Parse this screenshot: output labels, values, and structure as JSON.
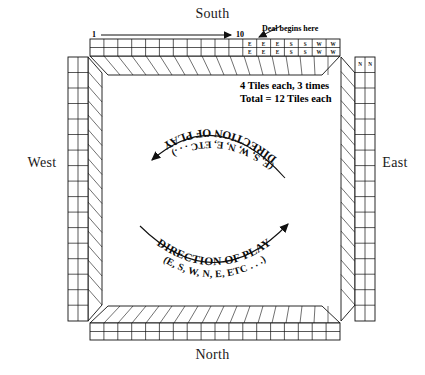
{
  "diagram": {
    "background_color": "#ffffff",
    "ink_color": "#111111"
  },
  "compass": {
    "south": "South",
    "north": "North",
    "west": "West",
    "east": "East"
  },
  "annotations": {
    "deal_begins": "Deal begins here",
    "range_start": "1",
    "range_end": "10",
    "tiles_line1": "4 Tiles each, 3 times",
    "tiles_line2": "Total = 12 Tiles each"
  },
  "arcs": [
    {
      "id": "upper",
      "title": "DIRECTION OF PLAY",
      "subtitle": "(E, S, W, N, E, ETC . . .)",
      "arrow_end": "left"
    },
    {
      "id": "lower",
      "title": "DIRECTION OF PLAY",
      "subtitle": "(E, S, W, N, E, ETC . . .)",
      "arrow_end": "right"
    }
  ],
  "walls": {
    "south_wall": {
      "columns": 18,
      "rows": 2,
      "labeled_tiles": [
        "E",
        "E",
        "E",
        "S",
        "S",
        "W",
        "W",
        "N"
      ],
      "labeled_start_column": 11
    },
    "north_wall": {
      "columns": 18,
      "rows": 2,
      "labeled_tiles": []
    },
    "west_wall": {
      "columns": 2,
      "rows": 17,
      "labeled_tiles": []
    },
    "east_wall": {
      "columns": 2,
      "rows": 17,
      "labeled_tiles": [
        "N",
        "N"
      ]
    }
  }
}
